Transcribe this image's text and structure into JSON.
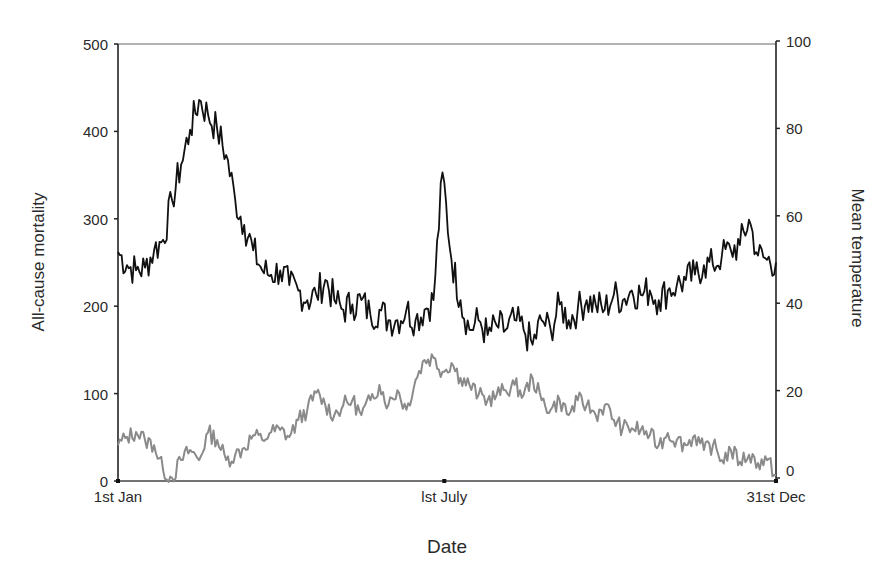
{
  "chart_data": {
    "type": "line",
    "title": "",
    "xlabel": "Date",
    "ylabel": "All-cause mortality",
    "y2label": "Mean temperature",
    "x_tick_labels": [
      "1st Jan",
      "lst July",
      "31st Dec"
    ],
    "x_tick_days": [
      0,
      181,
      365
    ],
    "xlim_days": [
      0,
      365
    ],
    "ylim": [
      0,
      500
    ],
    "y_ticks": [
      0,
      100,
      200,
      300,
      400,
      500
    ],
    "y2lim": [
      0,
      100
    ],
    "y2_ticks": [
      0,
      20,
      40,
      60,
      80,
      100
    ],
    "grid": false,
    "legend": null,
    "x_days": [
      0,
      5,
      10,
      15,
      20,
      25,
      30,
      35,
      40,
      45,
      50,
      55,
      60,
      65,
      70,
      75,
      80,
      85,
      90,
      95,
      100,
      105,
      110,
      115,
      120,
      125,
      130,
      135,
      140,
      145,
      150,
      155,
      160,
      165,
      170,
      175,
      180,
      185,
      190,
      195,
      200,
      205,
      210,
      215,
      220,
      225,
      230,
      235,
      240,
      245,
      250,
      255,
      260,
      265,
      270,
      275,
      280,
      285,
      290,
      295,
      300,
      305,
      310,
      315,
      320,
      325,
      330,
      335,
      340,
      345,
      350,
      355,
      360,
      365
    ],
    "series": [
      {
        "name": "All-cause mortality",
        "axis": "left",
        "color": "#111111",
        "values": [
          262,
          247,
          241,
          244,
          264,
          276,
          321,
          362,
          402,
          436,
          419,
          402,
          373,
          322,
          293,
          264,
          241,
          236,
          241,
          224,
          218,
          207,
          213,
          230,
          207,
          196,
          202,
          207,
          190,
          196,
          184,
          184,
          196,
          184,
          196,
          207,
          353,
          253,
          207,
          173,
          184,
          167,
          178,
          173,
          184,
          173,
          156,
          184,
          173,
          202,
          184,
          196,
          207,
          202,
          196,
          213,
          207,
          218,
          213,
          218,
          207,
          218,
          224,
          230,
          236,
          247,
          247,
          258,
          264,
          270,
          299,
          258,
          253,
          250
        ]
      },
      {
        "name": "Mean temperature",
        "axis": "right",
        "color": "#8a8a8a",
        "values": [
          7.5,
          9.4,
          10.5,
          8.7,
          7.5,
          1.8,
          0,
          4.1,
          6.4,
          4.1,
          10.5,
          8.7,
          4.1,
          5.3,
          6.9,
          9.8,
          8.7,
          10.5,
          11,
          9.4,
          13.3,
          15.6,
          19.5,
          16.7,
          14.4,
          16.7,
          17.8,
          14.4,
          17.8,
          21.3,
          16.7,
          20.1,
          15.6,
          22.4,
          27,
          27.5,
          24.3,
          26.3,
          22.9,
          21.3,
          19,
          17.8,
          19,
          20.1,
          21.3,
          19,
          22.9,
          17.8,
          15.6,
          17.8,
          14.4,
          17.8,
          16.7,
          14.4,
          16.7,
          13.3,
          11.4,
          11.4,
          11,
          9.8,
          7.5,
          10.3,
          8.7,
          7.5,
          9.8,
          6.4,
          7.5,
          4.1,
          6.4,
          3.7,
          5.3,
          3.4,
          4.1,
          0.7
        ]
      }
    ]
  }
}
